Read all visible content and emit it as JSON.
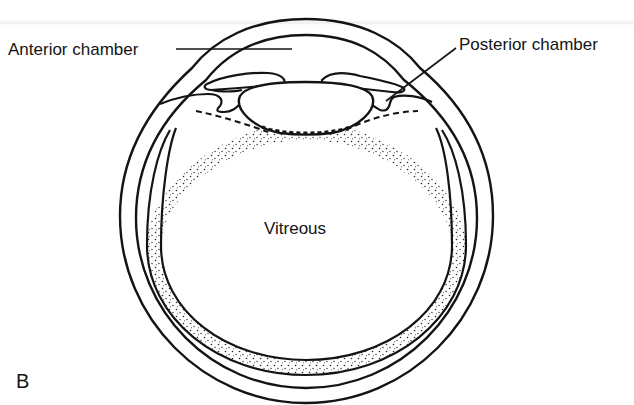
{
  "figure": {
    "panel_label": "B"
  },
  "labels": {
    "anterior_chamber": "Anterior chamber",
    "posterior_chamber": "Posterior chamber",
    "vitreous": "Vitreous"
  },
  "colors": {
    "line": "#141414",
    "background": "#ffffff",
    "stipple": "#2a2a2a"
  }
}
